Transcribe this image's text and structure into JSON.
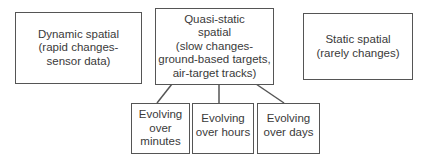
{
  "nodes": {
    "dynamic": {
      "label": "Dynamic spatial\n(rapid changes-\nsensor data)"
    },
    "quasi": {
      "label": "Quasi-static\nspatial\n(slow changes-\nground-based targets,\nair-target tracks)"
    },
    "static": {
      "label": "Static spatial\n(rarely changes)"
    },
    "minutes": {
      "label": "Evolving\nover\nminutes"
    },
    "hours": {
      "label": "Evolving\nover hours"
    },
    "days": {
      "label": "Evolving\nover days"
    }
  },
  "edges": [
    {
      "from": "quasi",
      "to": "minutes"
    },
    {
      "from": "quasi",
      "to": "hours"
    },
    {
      "from": "quasi",
      "to": "days"
    }
  ],
  "colors": {
    "stroke": "#555555",
    "text": "#3a3a3a",
    "background": "#ffffff"
  }
}
